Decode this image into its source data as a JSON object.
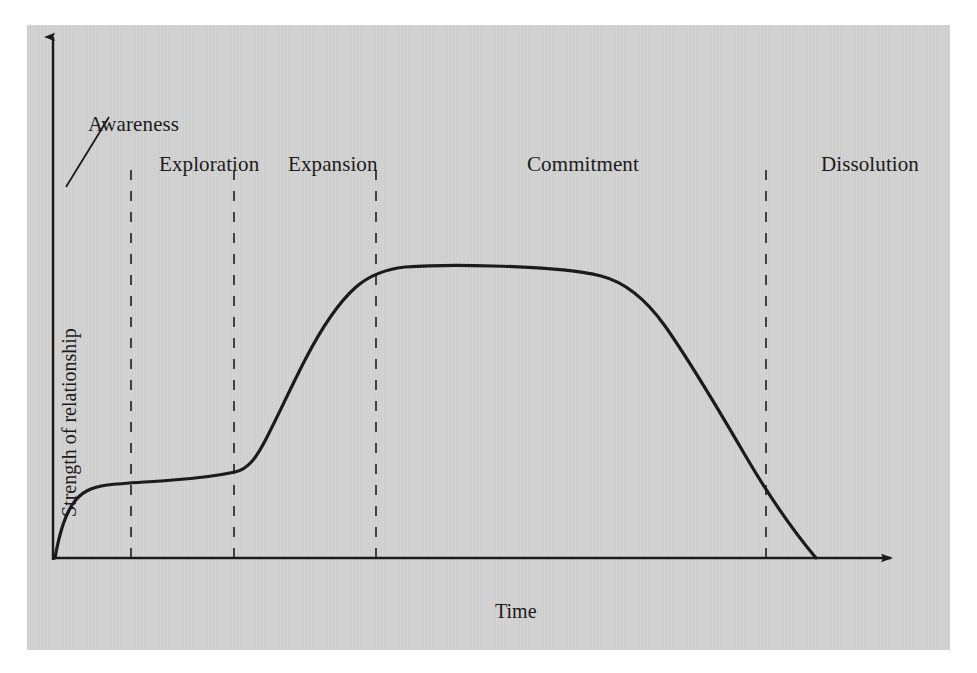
{
  "figure": {
    "panel_background": "#d2d2d2",
    "page_background": "#ffffff",
    "ink_color": "#1b1b1b"
  },
  "axes": {
    "x_label": "Time",
    "y_label": "Strength of relationship",
    "x_axis_y_px": 583,
    "y_axis_x_px": 80,
    "x_axis_start_px": 80,
    "x_axis_end_px": 925,
    "y_axis_top_px": 58,
    "ticks_shown": false,
    "grid": false
  },
  "annotations": {
    "awareness_leader_line": {
      "name": "awareness-leader-line",
      "x1": 136,
      "y1": 142,
      "x2": 93,
      "y2": 212
    }
  },
  "stages": [
    {
      "id": "awareness",
      "label": "Awareness",
      "label_x": 88,
      "label_y": 112,
      "divider_x": null
    },
    {
      "id": "exploration",
      "label": "Exploration",
      "label_x": 159,
      "label_y": 152,
      "divider_x": 158
    },
    {
      "id": "expansion",
      "label": "Expansion",
      "label_x": 288,
      "label_y": 152,
      "divider_x": 261
    },
    {
      "id": "commitment",
      "label": "Commitment",
      "label_x": 527,
      "label_y": 152,
      "divider_x": 403
    },
    {
      "id": "dissolution",
      "label": "Dissolution",
      "label_x": 821,
      "label_y": 152,
      "divider_x": 793
    }
  ],
  "dividers": {
    "style": "dashed",
    "top_y": 195,
    "bottom_y": 583,
    "x_positions": [
      158,
      261,
      403,
      793
    ],
    "color": "#3a3a3a"
  },
  "chart_data": {
    "type": "line",
    "title": "",
    "subtitle": "",
    "xlabel": "Time",
    "ylabel": "Strength of relationship",
    "xlim": [
      0,
      1
    ],
    "ylim": [
      0,
      1
    ],
    "grid": false,
    "legend": null,
    "axis_ticks": {
      "x": [],
      "y": []
    },
    "annotations": [
      "Awareness",
      "Exploration",
      "Expansion",
      "Commitment",
      "Dissolution"
    ],
    "stage_boundaries_x": [
      0.092,
      0.214,
      0.382,
      0.844
    ],
    "series": [
      {
        "name": "Strength of relationship",
        "color": "#1b1b1b",
        "width": 3.2,
        "x": [
          0.0,
          0.006,
          0.013,
          0.024,
          0.036,
          0.053,
          0.071,
          0.092,
          0.118,
          0.154,
          0.19,
          0.214,
          0.237,
          0.26,
          0.284,
          0.308,
          0.331,
          0.355,
          0.382,
          0.408,
          0.432,
          0.456,
          0.485,
          0.52,
          0.568,
          0.627,
          0.686,
          0.722,
          0.757,
          0.793,
          0.816,
          0.834,
          0.844,
          0.9
        ],
        "y": [
          0.0,
          0.035,
          0.062,
          0.09,
          0.105,
          0.116,
          0.123,
          0.128,
          0.132,
          0.139,
          0.147,
          0.152,
          0.172,
          0.212,
          0.273,
          0.343,
          0.42,
          0.497,
          0.576,
          0.637,
          0.48,
          0.545,
          0.552,
          0.554,
          0.554,
          0.55,
          0.53,
          0.488,
          0.395,
          0.262,
          0.148,
          0.045,
          0.0,
          0.0
        ]
      }
    ],
    "curve_px": {
      "description": "Hand-drawn S-curve: sharp initial rise, long shallow plateau through Exploration, steep climb through Expansion, flat peak across Commitment, steep decline through Dissolution to baseline.",
      "path": "M 82,583 C 86,560 92,541 99,530 C 108,516 120,512 134,510 C 152,508 175,507 200,505 C 228,503 248,500 262,497 C 276,494 284,481 292,466 C 305,441 318,412 332,385 C 348,354 366,327 383,312 C 398,299 414,294 432,292 C 460,290 492,290 520,291 C 560,292 600,294 628,301 C 652,307 672,323 692,351 C 716,385 744,432 772,480 C 796,521 822,558 843,583"
    }
  }
}
